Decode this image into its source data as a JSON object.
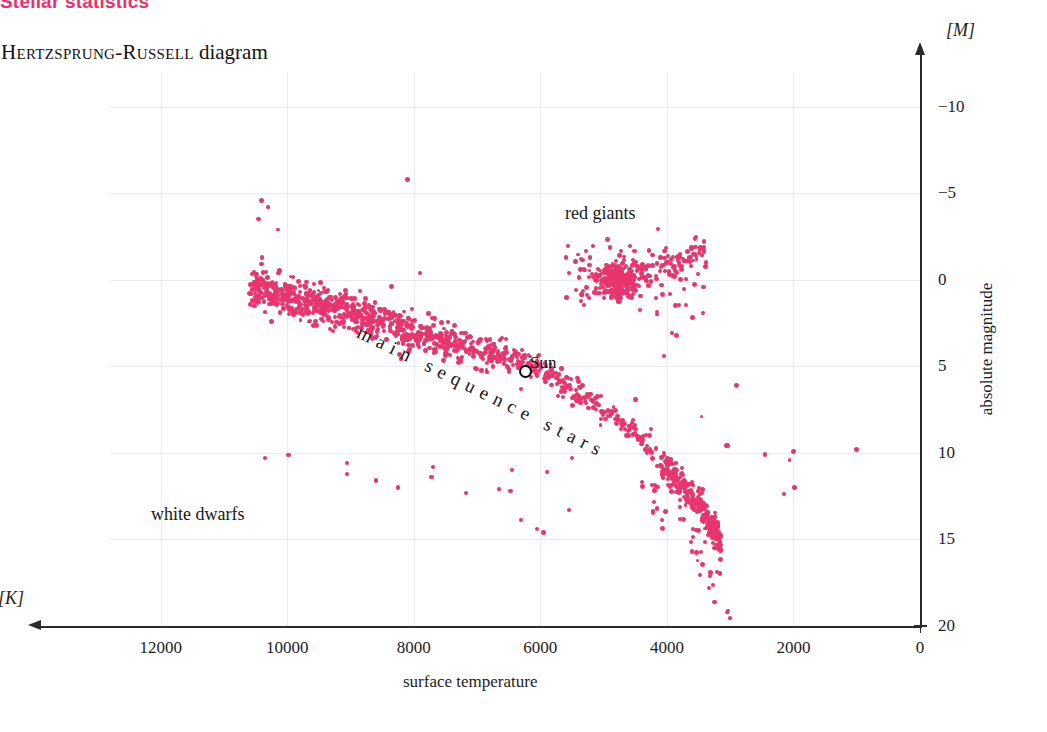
{
  "page": {
    "kicker": "Stellar statistics",
    "figure_title_smallcaps": "Hertzsprung-Russell",
    "figure_title_rest": "diagram"
  },
  "axes": {
    "x_unit": "[K]",
    "y_unit": "[M]",
    "x_title": "surface temperature",
    "y_title": "absolute magnitude",
    "x_ticks": [
      "12000",
      "10000",
      "8000",
      "6000",
      "4000",
      "2000",
      "0"
    ],
    "y_ticks": [
      "-10",
      "-5",
      "0",
      "5",
      "10",
      "15",
      "20"
    ]
  },
  "annotations": {
    "red_giants": "red giants",
    "white_dwarfs": "white dwarfs",
    "main_sequence": "main sequence stars",
    "sun": "Sun"
  },
  "colors": {
    "accent": "#e5336b",
    "points": "#e8356d",
    "grid": "#ececec",
    "axis": "#2a2a2a"
  },
  "chart_data": {
    "type": "scatter",
    "title": "Hertzsprung-Russell diagram",
    "xlabel": "surface temperature",
    "ylabel": "absolute magnitude",
    "xunit": "[K]",
    "yunit": "[M]",
    "xlim": [
      12800,
      0
    ],
    "ylim": [
      -12,
      20
    ],
    "x_reversed": true,
    "y_reversed": true,
    "grid": true,
    "legend": "none",
    "xticks": [
      12000,
      10000,
      8000,
      6000,
      4000,
      2000,
      0
    ],
    "yticks": [
      -10,
      -5,
      0,
      5,
      10,
      15,
      20
    ],
    "marker_size_px": 4,
    "point_color": "#e8356d",
    "groups": [
      {
        "name": "main sequence stars",
        "label_position": {
          "x": 7200,
          "y": 5.0
        },
        "description": "dense diagonal band from hot/bright upper-left to cool/faint lower-right, steepening below 4000 K",
        "n_points": 900
      },
      {
        "name": "red giants",
        "label_position": {
          "x": 5200,
          "y": -4.2
        },
        "description": "dense clump near 4800 K at magnitude 0 with branch rising toward 3400 K",
        "n_points": 330
      },
      {
        "name": "white dwarfs",
        "label_position": {
          "x": 7600,
          "y": 13.3
        },
        "description": "sparse scattered points between 10000 K and 5500 K at magnitudes 10 to 14",
        "n_points": 18
      }
    ],
    "markers": [
      {
        "name": "Sun",
        "x": 5780,
        "y": 4.8,
        "style": "open-circle-black"
      }
    ],
    "notable_outliers": [
      {
        "x": 8100,
        "y": -5.8,
        "note": "isolated bright star"
      },
      {
        "x": 10400,
        "y": -4.6,
        "note": "hot bright star"
      },
      {
        "x": 1000,
        "y": 9.8,
        "note": "isolated cool faint star"
      }
    ]
  }
}
